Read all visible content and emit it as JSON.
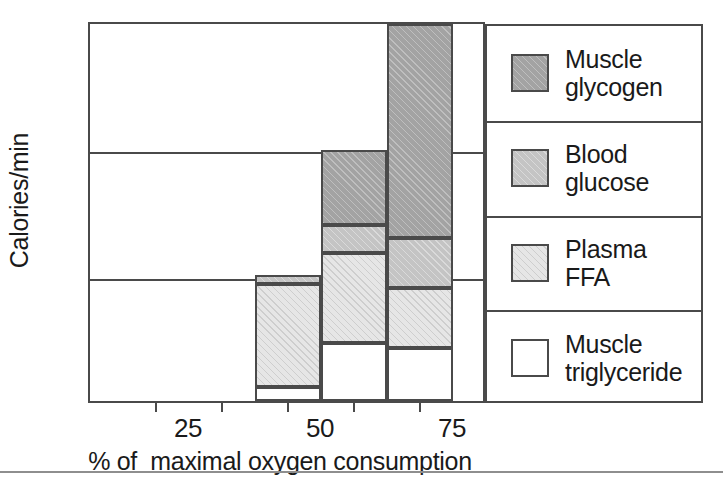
{
  "chart_data": {
    "type": "bar",
    "stacked": true,
    "title": "",
    "xlabel": "% of  maximal oxygen consumption",
    "ylabel": "Calories/min",
    "categories": [
      "25",
      "50",
      "75"
    ],
    "ylim": [
      0,
      15
    ],
    "yticks": [
      0,
      5,
      10,
      15
    ],
    "ytick_labels": [
      "0",
      "5",
      "10",
      "15"
    ],
    "xtick_labels": [
      "25",
      "50",
      "75"
    ],
    "grid": "horizontal gridlines at 5, 10, 15",
    "legend_position": "right",
    "series": [
      {
        "name": "Muscle glycogen",
        "swatch": "dark-gray-hatch",
        "color": "#a3a3a3",
        "values": [
          0,
          3.0,
          8.5
        ]
      },
      {
        "name": "Blood glucose",
        "swatch": "medium-gray-hatch",
        "color": "#c4c4c4",
        "values": [
          0.35,
          1.1,
          2.0
        ]
      },
      {
        "name": "Plasma FFA",
        "swatch": "light-gray-hatch",
        "color": "#e6e6e6",
        "values": [
          4.1,
          3.6,
          2.4
        ]
      },
      {
        "name": "Muscle triglyceride",
        "swatch": "white",
        "color": "#ffffff",
        "values": [
          0.55,
          2.3,
          2.1
        ]
      }
    ],
    "totals": [
      5.0,
      10.0,
      15.0
    ]
  },
  "axis": {
    "y_label": "Calories/min",
    "y_ticks": [
      "15",
      "10",
      "5",
      "0"
    ],
    "x_label": "% of  maximal oxygen consumption",
    "x_ticks": [
      "25",
      "50",
      "75"
    ]
  },
  "legend": {
    "entries": [
      {
        "label_line1": "Muscle",
        "label_line2": "glycogen"
      },
      {
        "label_line1": "Blood",
        "label_line2": "glucose"
      },
      {
        "label_line1": "Plasma",
        "label_line2": "FFA"
      },
      {
        "label_line1": "Muscle",
        "label_line2": "triglyceride"
      }
    ]
  },
  "colors": {
    "axis": "#4a4a4a",
    "glycogen": "#a3a3a3",
    "glucose": "#c4c4c4",
    "ffa": "#e6e6e6",
    "triglyceride": "#ffffff"
  }
}
